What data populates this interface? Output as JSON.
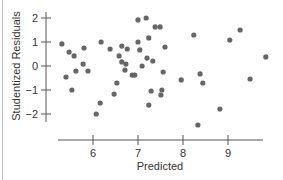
{
  "chart_data": {
    "type": "scatter",
    "title": "",
    "xlabel": "Predicted",
    "ylabel": "Studentized Residuals",
    "xlim": [
      5.65,
      10.2
    ],
    "ylim": [
      -2,
      2
    ],
    "xticks": [
      6,
      7,
      8,
      9
    ],
    "yticks": [
      2,
      1,
      0,
      -1,
      -2
    ],
    "xtick_labels": [
      "6",
      "7",
      "8",
      "9"
    ],
    "ytick_labels": [
      "2",
      "1",
      "0",
      "−1",
      "−2"
    ],
    "grid": false,
    "legend": "none",
    "point_color": "#666666",
    "points": [
      {
        "x": 5.31,
        "y": 0.92
      },
      {
        "x": 5.47,
        "y": 0.58
      },
      {
        "x": 5.58,
        "y": 0.42
      },
      {
        "x": 5.8,
        "y": 0.75
      },
      {
        "x": 6.18,
        "y": 1.0
      },
      {
        "x": 6.38,
        "y": 0.71
      },
      {
        "x": 5.78,
        "y": 0.08
      },
      {
        "x": 5.62,
        "y": -0.21
      },
      {
        "x": 5.89,
        "y": -0.21
      },
      {
        "x": 5.4,
        "y": -0.46
      },
      {
        "x": 5.53,
        "y": -1.0
      },
      {
        "x": 6.16,
        "y": -1.54
      },
      {
        "x": 6.07,
        "y": -2.0
      },
      {
        "x": 6.76,
        "y": 0.71
      },
      {
        "x": 6.58,
        "y": 0.42
      },
      {
        "x": 6.64,
        "y": 0.83
      },
      {
        "x": 6.64,
        "y": 0.17
      },
      {
        "x": 6.71,
        "y": -0.17
      },
      {
        "x": 6.73,
        "y": 0.08
      },
      {
        "x": 7.09,
        "y": 0.0
      },
      {
        "x": 7.04,
        "y": 0.67
      },
      {
        "x": 6.87,
        "y": -0.38
      },
      {
        "x": 7.0,
        "y": 1.92
      },
      {
        "x": 7.18,
        "y": 2.0
      },
      {
        "x": 7.38,
        "y": 1.63
      },
      {
        "x": 7.0,
        "y": 1.0
      },
      {
        "x": 7.24,
        "y": 1.17
      },
      {
        "x": 7.2,
        "y": 0.33
      },
      {
        "x": 7.33,
        "y": 0.21
      },
      {
        "x": 6.93,
        "y": -0.38
      },
      {
        "x": 6.53,
        "y": -0.71
      },
      {
        "x": 6.47,
        "y": -1.17
      },
      {
        "x": 7.29,
        "y": -1.04
      },
      {
        "x": 7.53,
        "y": -1.0
      },
      {
        "x": 7.51,
        "y": -1.21
      },
      {
        "x": 7.24,
        "y": -1.63
      },
      {
        "x": 7.56,
        "y": -0.25
      },
      {
        "x": 7.6,
        "y": 0.79
      },
      {
        "x": 7.49,
        "y": 1.63
      },
      {
        "x": 8.24,
        "y": 1.29
      },
      {
        "x": 7.96,
        "y": -0.58
      },
      {
        "x": 8.38,
        "y": -0.33
      },
      {
        "x": 8.44,
        "y": -0.71
      },
      {
        "x": 8.82,
        "y": -1.79
      },
      {
        "x": 8.33,
        "y": -2.46
      },
      {
        "x": 9.04,
        "y": 1.08
      },
      {
        "x": 9.27,
        "y": 1.5
      },
      {
        "x": 9.49,
        "y": -0.54
      },
      {
        "x": 9.84,
        "y": 0.38
      }
    ]
  }
}
